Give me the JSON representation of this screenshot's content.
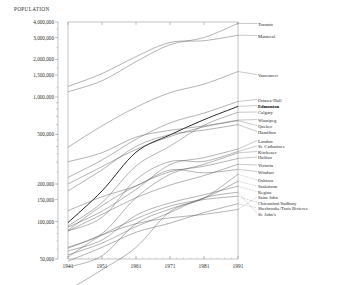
{
  "chart_data": {
    "type": "line",
    "title": "POPULATION",
    "xlabel": "",
    "ylabel": "POPULATION",
    "grid": false,
    "legend_position": "right-inline-labels",
    "yscale": "log",
    "ylim": [
      50000,
      4000000
    ],
    "xlim": [
      1941,
      1991
    ],
    "x": [
      1941,
      1951,
      1961,
      1971,
      1981,
      1991
    ],
    "xticklabels": [
      "1941",
      "1951",
      "1961",
      "1971",
      "1981",
      "1991"
    ],
    "yticklabels": [
      "4,000,000",
      "3,000,000",
      "2,000,000",
      "1,500,000",
      "1,000,000",
      "500,000",
      "200,000",
      "150,000",
      "100,000",
      "50,000"
    ],
    "ytickvalues": [
      4000000,
      3000000,
      2000000,
      1500000,
      1000000,
      500000,
      200000,
      150000,
      100000,
      50000
    ],
    "series": [
      {
        "name": "Toronto",
        "highlight": false,
        "values": [
          1100000,
          1350000,
          1920000,
          2630000,
          3000000,
          3900000
        ]
      },
      {
        "name": "Montreal",
        "highlight": false,
        "values": [
          1215000,
          1540000,
          2110000,
          2740000,
          2830000,
          3130000
        ]
      },
      {
        "name": "Vancouver",
        "highlight": false,
        "values": [
          395000,
          586000,
          827000,
          1082000,
          1268000,
          1600000
        ]
      },
      {
        "name": "Ottawa-Hull",
        "highlight": false,
        "values": [
          226000,
          312000,
          457000,
          619000,
          743000,
          920000
        ]
      },
      {
        "name": "Edmonton",
        "highlight": true,
        "values": [
          98000,
          176000,
          360000,
          496000,
          657000,
          840000
        ]
      },
      {
        "name": "Calgary",
        "highlight": false,
        "values": [
          92000,
          142000,
          279000,
          403000,
          593000,
          754000
        ]
      },
      {
        "name": "Winnipeg",
        "highlight": false,
        "values": [
          302000,
          357000,
          476000,
          540000,
          585000,
          652000
        ]
      },
      {
        "name": "Quebec",
        "highlight": false,
        "values": [
          200000,
          276000,
          379000,
          481000,
          576000,
          646000
        ]
      },
      {
        "name": "Hamilton",
        "highlight": false,
        "values": [
          176000,
          260000,
          401000,
          499000,
          542000,
          600000
        ]
      },
      {
        "name": "London",
        "highlight": false,
        "values": [
          90000,
          121000,
          181000,
          286000,
          326000,
          382000
        ]
      },
      {
        "name": "St. Catharines",
        "highlight": false,
        "values": [
          84000,
          108000,
          217000,
          303000,
          304000,
          365000
        ]
      },
      {
        "name": "Kitchener",
        "highlight": false,
        "values": [
          62000,
          80000,
          155000,
          239000,
          288000,
          356000
        ]
      },
      {
        "name": "Halifax",
        "highlight": false,
        "values": [
          85000,
          134000,
          193000,
          251000,
          278000,
          321000
        ]
      },
      {
        "name": "Victoria",
        "highlight": false,
        "values": [
          84000,
          114000,
          155000,
          196000,
          234000,
          288000
        ]
      },
      {
        "name": "Windsor",
        "highlight": false,
        "values": [
          122000,
          158000,
          193000,
          259000,
          246000,
          262000
        ]
      },
      {
        "name": "Oshawa",
        "highlight": false,
        "values": [
          28000,
          41000,
          62000,
          120000,
          154000,
          240000
        ]
      },
      {
        "name": "Saskatoon",
        "highlight": false,
        "values": [
          43000,
          53000,
          96000,
          126000,
          154000,
          210000
        ]
      },
      {
        "name": "Regina",
        "highlight": false,
        "values": [
          58000,
          71000,
          112000,
          141000,
          164000,
          192000
        ]
      },
      {
        "name": "Saint John",
        "highlight": false,
        "values": [
          61000,
          78000,
          96000,
          107000,
          114000,
          125000
        ]
      },
      {
        "name": "Chicoutimi/Sudbury",
        "highlight": false,
        "values": [
          52000,
          78000,
          105000,
          133000,
          150000,
          160000
        ]
      },
      {
        "name": "Sherbrooke/Trois-Rivières",
        "highlight": false,
        "values": [
          48000,
          62000,
          82000,
          97000,
          118000,
          139000
        ]
      },
      {
        "name": "St. John's",
        "highlight": false,
        "values": [
          54000,
          67000,
          91000,
          118000,
          155000,
          172000
        ]
      }
    ]
  },
  "labels": {
    "toronto": "Toronto",
    "montreal": "Montreal",
    "vancouver": "Vancouver",
    "ottawa": "Ottawa-Hull",
    "edmonton": "Edmonton",
    "calgary": "Calgary",
    "winnipeg": "Winnipeg",
    "quebec": "Quebec",
    "hamilton": "Hamilton",
    "london": "London",
    "stcatharines": "St. Catharines",
    "kitchener": "Kitchener",
    "halifax": "Halifax",
    "victoria": "Victoria",
    "windsor": "Windsor",
    "oshawa": "Oshawa",
    "saskatoon": "Saskatoon",
    "regina": "Regina",
    "saintjohn": "Saint John",
    "chicoutimi": "Chicoutimi/Sudbury",
    "sherbrooke": "Sherbrooke/Trois Rivieres",
    "stjohns": "St. John's"
  },
  "yaxis": {
    "t0": "4,000,000",
    "t1": "3,000,000",
    "t2": "2,000,000",
    "t3": "1,500,000",
    "t4": "1,000,000",
    "t5": "500,000",
    "t6": "200,000",
    "t7": "150,000",
    "t8": "100,000",
    "t9": "50,000"
  },
  "xaxis": {
    "t0": "1941",
    "t1": "1951",
    "t2": "1961",
    "t3": "1971",
    "t4": "1981",
    "t5": "1991"
  },
  "colors": {
    "line": "#555555",
    "highlight": "#000000",
    "axis": "#7a7a7a",
    "text": "#2b2b2b"
  }
}
